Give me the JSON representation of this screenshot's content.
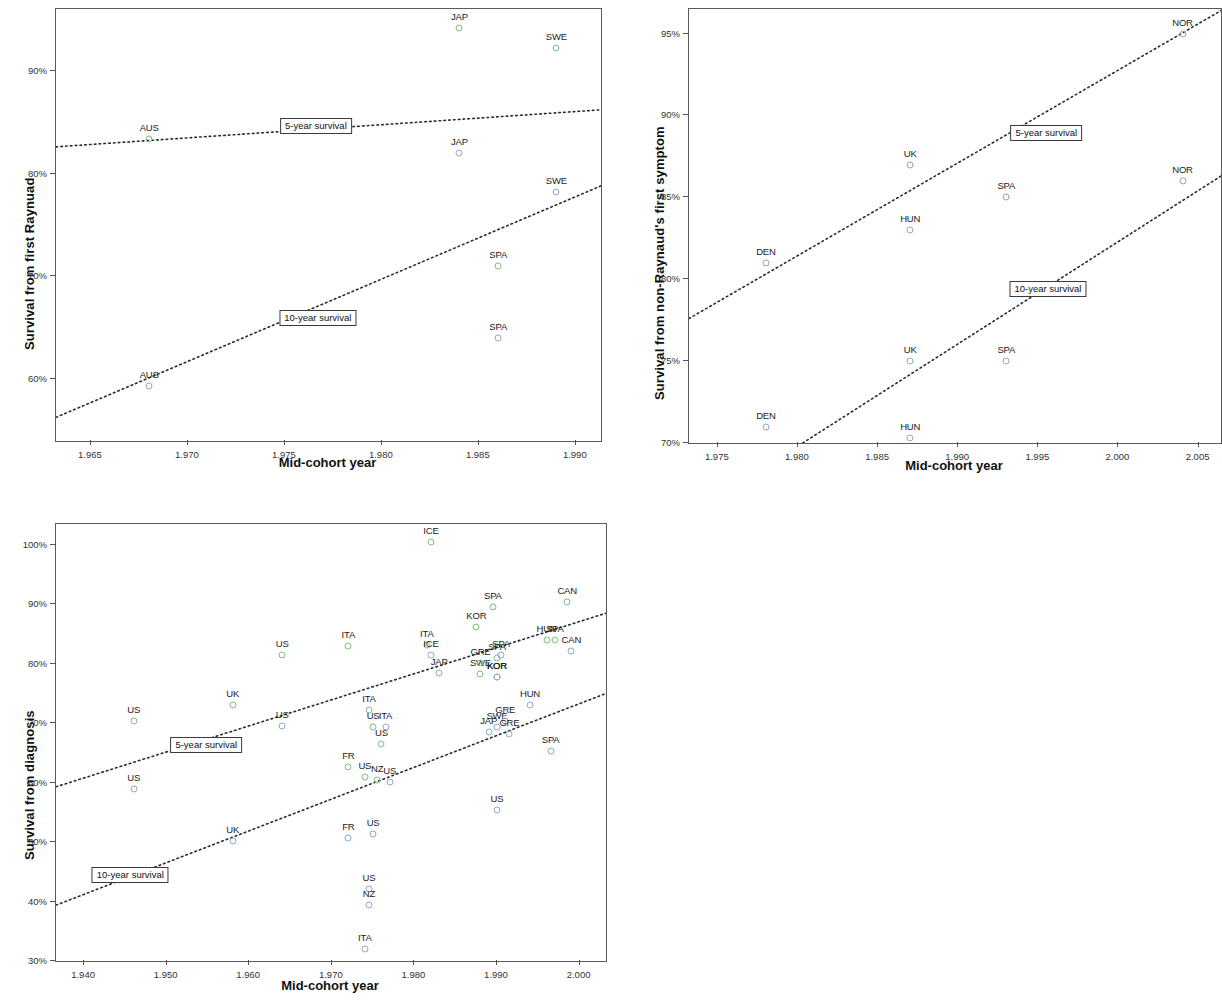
{
  "figure": {
    "panels": [
      {
        "id": "panel-raynaud",
        "ylabel": "Survival from first Raynuad",
        "xlabel": "Mid-cohort year"
      },
      {
        "id": "panel-non-raynaud",
        "ylabel": "Survival from non-Raynaud's first symptom",
        "xlabel": "Mid-cohort year"
      },
      {
        "id": "panel-diagnosis",
        "ylabel": "Survival from diagnosis",
        "xlabel": "Mid-cohort year"
      }
    ],
    "colors": {
      "five_year_marker": "#7fbf7f",
      "ten_year_marker": "#8fa8d8",
      "trend_line": "#2b2b2b",
      "axis": "#5a5a5a"
    }
  },
  "chart_data": [
    {
      "type": "scatter",
      "id": "panel-raynaud",
      "title": "",
      "xlabel": "Mid-cohort year",
      "ylabel": "Survival from first Raynuad",
      "xlim": [
        1963.2,
        1991.3
      ],
      "ylim": [
        54.0,
        96.0
      ],
      "xticks": [
        1965,
        1970,
        1975,
        1980,
        1985,
        1990
      ],
      "xticklabels": [
        "1.965",
        "1.970",
        "1.975",
        "1.980",
        "1.985",
        "1.990"
      ],
      "yticks": [
        60,
        70,
        80,
        90
      ],
      "yticklabels": [
        "60%",
        "70%",
        "80%",
        "90%"
      ],
      "grid": false,
      "legend": "none",
      "annotations": [
        {
          "text": "5-year survival",
          "x": 1976.6,
          "y": 84.6
        },
        {
          "text": "10-year survival",
          "x": 1976.7,
          "y": 66.0
        }
      ],
      "series": [
        {
          "name": "5-year survival",
          "color": "#7fbf7f",
          "points": [
            {
              "label": "AUS",
              "x": 1968.0,
              "y": 83.4
            },
            {
              "label": "JAP",
              "x": 1984.0,
              "y": 94.2
            },
            {
              "label": "SWE",
              "x": 1989.0,
              "y": 92.2
            },
            {
              "label": "SPA",
              "x": 1986.0,
              "y": 71.0
            }
          ],
          "trend": {
            "x0": 1963.2,
            "y0": 82.6,
            "x1": 1991.3,
            "y1": 86.2
          }
        },
        {
          "name": "10-year survival",
          "color": "#8fa8d8",
          "points": [
            {
              "label": "AUS",
              "x": 1968.0,
              "y": 59.3
            },
            {
              "label": "JAP",
              "x": 1984.0,
              "y": 82.0
            },
            {
              "label": "SWE",
              "x": 1989.0,
              "y": 78.2
            },
            {
              "label": "SPA",
              "x": 1986.0,
              "y": 64.0
            }
          ],
          "trend": {
            "x0": 1963.2,
            "y0": 56.3,
            "x1": 1991.3,
            "y1": 78.8
          }
        }
      ]
    },
    {
      "type": "scatter",
      "id": "panel-non-raynaud",
      "title": "",
      "xlabel": "Mid-cohort year",
      "ylabel": "Survival from non-Raynaud's first symptom",
      "xlim": [
        1973.2,
        2006.4
      ],
      "ylim": [
        70.0,
        96.5
      ],
      "xticks": [
        1975,
        1980,
        1985,
        1990,
        1995,
        2000,
        2005
      ],
      "xticklabels": [
        "1.975",
        "1.980",
        "1.985",
        "1.990",
        "1.995",
        "2.000",
        "2.005"
      ],
      "yticks": [
        70,
        75,
        80,
        85,
        90,
        95
      ],
      "yticklabels": [
        "70%",
        "75%",
        "80%",
        "85%",
        "90%",
        "95%"
      ],
      "grid": false,
      "legend": "none",
      "annotations": [
        {
          "text": "5-year survival",
          "x": 1995.5,
          "y": 88.9
        },
        {
          "text": "10-year survival",
          "x": 1995.6,
          "y": 79.4
        }
      ],
      "series": [
        {
          "name": "5-year survival",
          "color": "#7fbf7f",
          "points": [
            {
              "label": "DEN",
              "x": 1978.0,
              "y": 81.0
            },
            {
              "label": "UK",
              "x": 1987.0,
              "y": 87.0
            },
            {
              "label": "HUN",
              "x": 1987.0,
              "y": 83.0
            },
            {
              "label": "SPA",
              "x": 1993.0,
              "y": 85.0
            },
            {
              "label": "NOR",
              "x": 2004.0,
              "y": 95.0
            }
          ],
          "trend": {
            "x0": 1973.2,
            "y0": 77.6,
            "x1": 2006.4,
            "y1": 96.4
          }
        },
        {
          "name": "10-year survival",
          "color": "#8fa8d8",
          "points": [
            {
              "label": "DEN",
              "x": 1978.0,
              "y": 71.0
            },
            {
              "label": "UK",
              "x": 1987.0,
              "y": 75.0
            },
            {
              "label": "HUN",
              "x": 1987.0,
              "y": 70.3
            },
            {
              "label": "SPA",
              "x": 1993.0,
              "y": 75.0
            },
            {
              "label": "NOR",
              "x": 2004.0,
              "y": 86.0
            }
          ],
          "trend": {
            "x0": 1980.3,
            "y0": 70.0,
            "x1": 2006.4,
            "y1": 86.3
          }
        }
      ]
    },
    {
      "type": "scatter",
      "id": "panel-diagnosis",
      "title": "",
      "xlabel": "Mid-cohort year",
      "ylabel": "Survival from diagnosis",
      "xlim": [
        1936.6,
        2003.2
      ],
      "ylim": [
        30.0,
        103.5
      ],
      "xticks": [
        1940,
        1950,
        1960,
        1970,
        1980,
        1990,
        2000
      ],
      "xticklabels": [
        "1.940",
        "1.950",
        "1.960",
        "1.970",
        "1.980",
        "1.990",
        "2.000"
      ],
      "yticks": [
        30,
        40,
        50,
        60,
        70,
        80,
        90,
        100
      ],
      "yticklabels": [
        "30%",
        "40%",
        "50%",
        "60%",
        "70%",
        "80%",
        "90%",
        "100%"
      ],
      "grid": false,
      "legend": "none",
      "annotations": [
        {
          "text": "5-year survival",
          "x": 1954.8,
          "y": 66.3
        },
        {
          "text": "10-year survival",
          "x": 1945.6,
          "y": 44.5
        }
      ],
      "series": [
        {
          "name": "5-year survival",
          "color": "#7fbf7f",
          "points": [
            {
              "label": "US",
              "x": 1946.0,
              "y": 70.4
            },
            {
              "label": "UK",
              "x": 1958.0,
              "y": 73.1
            },
            {
              "label": "US",
              "x": 1964.0,
              "y": 81.5
            },
            {
              "label": "ITA",
              "x": 1972.0,
              "y": 83.0
            },
            {
              "label": "ITA",
              "x": 1974.5,
              "y": 72.2
            },
            {
              "label": "US",
              "x": 1975.0,
              "y": 69.3
            },
            {
              "label": "US",
              "x": 1976.0,
              "y": 66.5
            },
            {
              "label": "FR",
              "x": 1972.0,
              "y": 62.7
            },
            {
              "label": "US",
              "x": 1974.0,
              "y": 61.0
            },
            {
              "label": "NZ",
              "x": 1975.5,
              "y": 60.4
            },
            {
              "label": "ITA",
              "x": 1981.5,
              "y": 83.2
            },
            {
              "label": "ICE",
              "x": 1982.0,
              "y": 100.4
            },
            {
              "label": "JAP",
              "x": 1983.0,
              "y": 78.5
            },
            {
              "label": "KOR",
              "x": 1987.5,
              "y": 86.2
            },
            {
              "label": "SWE",
              "x": 1988.0,
              "y": 78.2
            },
            {
              "label": "SPA",
              "x": 1989.5,
              "y": 89.5
            },
            {
              "label": "GRE",
              "x": 1988.0,
              "y": 80.2
            },
            {
              "label": "SPA",
              "x": 1990.0,
              "y": 81.0
            },
            {
              "label": "KOR",
              "x": 1990.0,
              "y": 77.8
            },
            {
              "label": "HUN",
              "x": 1996.0,
              "y": 84.0
            },
            {
              "label": "SPA",
              "x": 1997.0,
              "y": 84.0
            },
            {
              "label": "CAN",
              "x": 1998.5,
              "y": 90.4
            }
          ],
          "trend": {
            "x0": 1936.6,
            "y0": 59.3,
            "x1": 2003.2,
            "y1": 88.5
          }
        },
        {
          "name": "10-year survival",
          "color": "#8fa8d8",
          "points": [
            {
              "label": "US",
              "x": 1946.0,
              "y": 59.0
            },
            {
              "label": "UK",
              "x": 1958.0,
              "y": 50.2
            },
            {
              "label": "US",
              "x": 1964.0,
              "y": 69.5
            },
            {
              "label": "FR",
              "x": 1972.0,
              "y": 50.7
            },
            {
              "label": "US",
              "x": 1975.0,
              "y": 51.3
            },
            {
              "label": "US",
              "x": 1974.5,
              "y": 42.1
            },
            {
              "label": "NZ",
              "x": 1974.5,
              "y": 39.5
            },
            {
              "label": "ITA",
              "x": 1974.0,
              "y": 32.0
            },
            {
              "label": "ITA",
              "x": 1976.5,
              "y": 69.3
            },
            {
              "label": "US",
              "x": 1977.0,
              "y": 60.1
            },
            {
              "label": "ICE",
              "x": 1982.0,
              "y": 81.4
            },
            {
              "label": "JAP",
              "x": 1989.0,
              "y": 68.5
            },
            {
              "label": "SWE",
              "x": 1990.0,
              "y": 69.3
            },
            {
              "label": "KOR",
              "x": 1990.0,
              "y": 77.8
            },
            {
              "label": "SPA",
              "x": 1990.5,
              "y": 81.4
            },
            {
              "label": "GRE",
              "x": 1991.0,
              "y": 70.4
            },
            {
              "label": "GRE",
              "x": 1991.5,
              "y": 68.2
            },
            {
              "label": "HUN",
              "x": 1994.0,
              "y": 73.0
            },
            {
              "label": "US",
              "x": 1990.0,
              "y": 55.4
            },
            {
              "label": "SPA",
              "x": 1996.5,
              "y": 65.3
            },
            {
              "label": "CAN",
              "x": 1999.0,
              "y": 82.2
            }
          ],
          "trend": {
            "x0": 1936.6,
            "y0": 39.4,
            "x1": 2003.2,
            "y1": 75.0
          }
        }
      ]
    }
  ]
}
